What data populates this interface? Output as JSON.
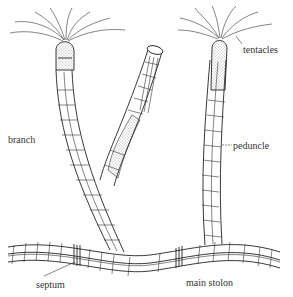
{
  "figure": {
    "labels": {
      "tentacles": "tentacles",
      "branch": "branch",
      "peduncle": "peduncle",
      "septum": "septum",
      "main_stolon": "main stolon"
    },
    "colors": {
      "background": "#ffffff",
      "ink": "#222222",
      "label_text": "#333333"
    }
  }
}
